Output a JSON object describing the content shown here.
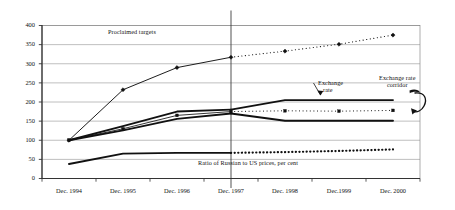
{
  "chart_data": {
    "type": "line",
    "title": "",
    "xlabel": "",
    "ylabel": "",
    "ylim": [
      0,
      400
    ],
    "ytick_values": [
      0,
      50,
      100,
      150,
      200,
      250,
      300,
      350,
      400
    ],
    "ytick_labels": [
      "0",
      "50",
      "100",
      "150",
      "200",
      "250",
      "300",
      "350",
      "400"
    ],
    "grid": "horizontal",
    "legend": "none",
    "categories": [
      "Dec. 1994",
      "Dec. 1995",
      "Dec. 1996",
      "Dec. 1997",
      "Dec. 1998",
      "Dec.1999",
      "Dec. 2000"
    ],
    "forecast_divider_category": "Dec. 1997",
    "series": [
      {
        "name": "Proclaimed targets",
        "marker": "diamond",
        "style_actual": "solid",
        "style_forecast": "dotted",
        "values": [
          100,
          232,
          290,
          317,
          333,
          351,
          375
        ]
      },
      {
        "name": "Exchange rate corridor upper bound",
        "marker": "none",
        "style_actual": "solid",
        "style_forecast": "solid",
        "values": [
          100,
          137,
          175,
          180,
          205,
          205,
          205
        ]
      },
      {
        "name": "Exchange rate corridor lower bound",
        "marker": "none",
        "style_actual": "solid",
        "style_forecast": "solid",
        "values": [
          100,
          126,
          156,
          170,
          151,
          151,
          151
        ]
      },
      {
        "name": "Exchange rate",
        "marker": "square",
        "style_actual": "solid",
        "style_forecast": "dotted",
        "values": [
          100,
          130,
          165,
          175,
          177,
          176,
          178
        ]
      },
      {
        "name": "Ratio of Russian to US prices, per cent",
        "marker": "none",
        "style_actual": "solid",
        "style_forecast": "dotted",
        "values": [
          38,
          65,
          67,
          67,
          69,
          72,
          76
        ]
      }
    ],
    "annotations": [
      {
        "id": "proclaimed",
        "text": "Proclaimed targets"
      },
      {
        "id": "exchange_rate_line1",
        "text": "Exchange"
      },
      {
        "id": "exchange_rate_line2",
        "text": "rate"
      },
      {
        "id": "corridor_line1",
        "text": "Exchange rate"
      },
      {
        "id": "corridor_line2",
        "text": "corridor"
      },
      {
        "id": "ratio",
        "text": "Ratio of Russian to US prices, per cent"
      }
    ],
    "colors": {
      "line": "#111111",
      "grid": "#8a8a8a",
      "axis": "#555555",
      "background": "#ffffff"
    }
  }
}
